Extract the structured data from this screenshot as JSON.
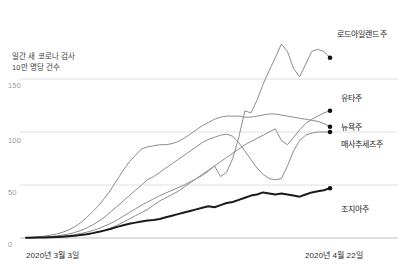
{
  "chart_data": {
    "type": "line",
    "title": "",
    "subtitle": "",
    "xlabel": "",
    "ylabel": "일간 새 코로나 검사\n10만 명당 건수",
    "ylabel_lines": [
      "일간 새 코로나 검사",
      "10만 명당 건수"
    ],
    "ylim": [
      0,
      180
    ],
    "yticks": [
      0,
      50,
      100,
      150
    ],
    "ytick_labels": [
      "0",
      "50",
      "100",
      "150"
    ],
    "grid": true,
    "grid_axis": "y",
    "legend": "right-endpoint-labels",
    "x_range_labels": [
      "2020년 3월 3일",
      "2020년 4월 22일"
    ],
    "xticks": [
      "2020년 3월 3일",
      "2020년 4월 22일"
    ],
    "x": [
      0,
      1,
      2,
      3,
      4,
      5,
      6,
      7,
      8,
      9,
      10,
      11,
      12,
      13,
      14,
      15,
      16,
      17,
      18,
      19,
      20,
      21,
      22,
      23,
      24,
      25,
      26,
      27,
      28,
      29,
      30,
      31,
      32,
      33,
      34,
      35,
      36,
      37,
      38,
      39,
      40,
      41,
      42,
      43,
      44,
      45,
      46,
      47,
      48,
      49,
      50
    ],
    "series": [
      {
        "name": "로드아일랜드주",
        "color": "#8c8c8c",
        "width": 1,
        "end_value": 170,
        "values": [
          0.4,
          0.5,
          0.6,
          0.8,
          1.0,
          1.4,
          1.8,
          2.4,
          3.2,
          4.2,
          5.5,
          7.0,
          9.0,
          11.5,
          14.0,
          17.0,
          20.5,
          24.0,
          27.5,
          31.0,
          34.0,
          37.0,
          40.0,
          42.5,
          45.0,
          47.5,
          50.0,
          53.0,
          56.0,
          59.0,
          63.0,
          68.0,
          58.0,
          62.0,
          75.0,
          95.0,
          120.0,
          118.0,
          130.0,
          145.0,
          158.0,
          170.0,
          183.0,
          176.0,
          160.0,
          152.0,
          164.0,
          176.0,
          178.0,
          176.0,
          170.0
        ]
      },
      {
        "name": "유타주",
        "color": "#8c8c8c",
        "width": 1,
        "end_value": 120,
        "values": [
          0.3,
          0.4,
          0.5,
          0.6,
          0.8,
          1.0,
          1.3,
          1.7,
          2.2,
          2.8,
          3.6,
          4.6,
          6.0,
          7.5,
          9.5,
          12.0,
          15.0,
          18.0,
          21.0,
          24.0,
          27.0,
          31.0,
          35.0,
          38.0,
          41.0,
          44.0,
          48.0,
          52.0,
          56.0,
          60.0,
          64.0,
          68.0,
          72.0,
          76.0,
          80.0,
          84.0,
          88.0,
          91.0,
          94.0,
          97.0,
          100.0,
          103.0,
          92.0,
          88.0,
          95.0,
          102.0,
          108.0,
          112.0,
          115.0,
          118.0,
          120.0
        ]
      },
      {
        "name": "뉴욕주",
        "color": "#8c8c8c",
        "width": 1,
        "end_value": 105,
        "values": [
          0.5,
          0.8,
          1.2,
          1.8,
          2.6,
          3.8,
          5.4,
          7.5,
          10.5,
          14.5,
          19.5,
          25.0,
          31.0,
          38.0,
          46.0,
          55.0,
          64.0,
          72.0,
          78.0,
          84.0,
          86.0,
          87.0,
          88.0,
          88.0,
          89.0,
          91.0,
          94.0,
          98.0,
          102.0,
          106.0,
          109.0,
          112.0,
          114.0,
          115.0,
          115.0,
          115.0,
          114.0,
          114.0,
          115.0,
          116.0,
          117.0,
          117.0,
          116.0,
          115.0,
          114.0,
          113.0,
          112.0,
          111.0,
          110.0,
          108.0,
          105.0
        ]
      },
      {
        "name": "매사추세츠주",
        "color": "#8c8c8c",
        "width": 1,
        "end_value": 100,
        "values": [
          0.3,
          0.4,
          0.6,
          0.9,
          1.3,
          1.9,
          2.7,
          3.8,
          5.2,
          7.0,
          9.5,
          12.5,
          16.0,
          20.0,
          25.0,
          30.0,
          35.0,
          40.0,
          45.0,
          50.0,
          55.0,
          58.0,
          62.0,
          66.0,
          70.0,
          74.0,
          78.0,
          82.0,
          86.0,
          90.0,
          93.0,
          95.0,
          97.0,
          98.0,
          96.0,
          90.0,
          82.0,
          74.0,
          66.0,
          60.0,
          56.0,
          55.0,
          56.0,
          68.0,
          82.0,
          92.0,
          97.0,
          99.0,
          100.0,
          100.0,
          100.0
        ]
      },
      {
        "name": "조지아주",
        "color": "#1a1a1a",
        "width": 2,
        "end_value": 47,
        "values": [
          0.2,
          0.3,
          0.4,
          0.5,
          0.7,
          0.9,
          1.2,
          1.6,
          2.1,
          2.8,
          3.6,
          4.6,
          5.8,
          7.2,
          8.8,
          10.5,
          12.0,
          13.5,
          14.5,
          15.5,
          16.5,
          17.0,
          18.0,
          19.5,
          21.0,
          22.5,
          24.0,
          25.5,
          27.0,
          28.5,
          30.0,
          29.0,
          31.0,
          33.0,
          34.0,
          36.0,
          38.0,
          40.0,
          41.0,
          43.0,
          42.0,
          41.0,
          42.0,
          41.0,
          40.0,
          39.0,
          41.0,
          43.0,
          44.0,
          45.0,
          47.0
        ]
      }
    ],
    "endpoint_markers": true
  },
  "labels": {
    "caption_line1": "일간 새 코로나 검사",
    "caption_line2": "10만 명당 건수",
    "ytick_150": "150",
    "ytick_100": "100",
    "ytick_50": "50",
    "ytick_0": "0",
    "xtick_start": "2020년 3월 3일",
    "xtick_end": "2020년 4월 22일",
    "series_rhode_island": "로드아일랜드주",
    "series_utah": "유타주",
    "series_new_york": "뉴욕주",
    "series_massachusetts": "매사추세츠주",
    "series_georgia": "조지아주"
  },
  "colors": {
    "grid": "#d8d8d8",
    "baseline": "#bdbdbd",
    "line_gray": "#8c8c8c",
    "line_black": "#1a1a1a",
    "text": "#1d1d1d",
    "tick_text": "#9a9a9a",
    "background": "#ffffff"
  }
}
